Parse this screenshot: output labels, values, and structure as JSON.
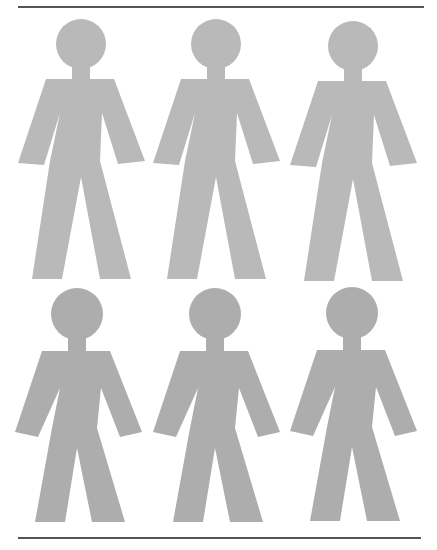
{
  "figure": {
    "type": "pictogram-grid",
    "rows": 2,
    "columns": 3,
    "count": 6,
    "icon": "person-icon",
    "colors": {
      "top_row": "#b9b9b9",
      "bottom_row": "#adadad",
      "rule": "#555555",
      "background": "#ffffff"
    },
    "rows_data": [
      {
        "row": "top",
        "figures": [
          {
            "id": "person-1",
            "cx": 81,
            "top": 19
          },
          {
            "id": "person-2",
            "cx": 216,
            "top": 19
          },
          {
            "id": "person-3",
            "cx": 353,
            "top": 21
          }
        ]
      },
      {
        "row": "bottom",
        "figures": [
          {
            "id": "person-4",
            "cx": 77,
            "top": 288
          },
          {
            "id": "person-5",
            "cx": 215,
            "top": 288
          },
          {
            "id": "person-6",
            "cx": 352,
            "top": 287
          }
        ]
      }
    ]
  }
}
